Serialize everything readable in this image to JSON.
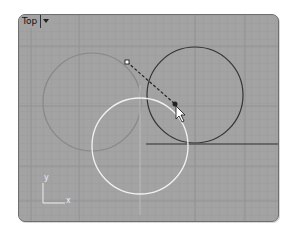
{
  "viewport": {
    "title": "Top",
    "menu_icon": "chevron-down-icon",
    "colors": {
      "background": "#a3a3a3",
      "grid_minor": "#9a9a9a",
      "grid_major": "#8c8c8c",
      "circle_gray": "#8a8a8a",
      "circle_dark": "#3a3a3a",
      "circle_white": "#f0f0f0"
    },
    "axis": {
      "x_label": "x",
      "y_label": "y"
    }
  }
}
